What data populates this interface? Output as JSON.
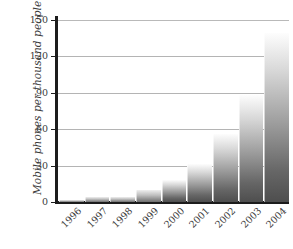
{
  "chart_data": {
    "type": "bar",
    "title": "",
    "xlabel": "",
    "ylabel": "Mobile phones per thousand people",
    "categories": [
      "1996",
      "1997",
      "1998",
      "1999",
      "2000",
      "2001",
      "2002",
      "2003",
      "2004"
    ],
    "values": [
      2,
      4,
      4,
      10,
      18,
      31,
      56,
      88,
      139
    ],
    "ylim": [
      0,
      150
    ],
    "yticks": [
      0,
      30,
      60,
      90,
      120,
      150
    ],
    "ytick_labels": [
      "0",
      "30",
      "60",
      "90",
      "120",
      "150"
    ],
    "grid": true,
    "legend": false,
    "legend_position": "none",
    "series": [
      {
        "name": "Mobile phones per thousand people",
        "values": [
          2,
          4,
          4,
          10,
          18,
          31,
          56,
          88,
          139
        ]
      }
    ],
    "bar_fill": "vertical-gradient-white-to-dark-gray",
    "colors": {
      "bar_top": "#fdfdfd",
      "bar_bottom": "#4e4e4e",
      "axis": "#1c1c1c",
      "gridline": "#b4b4b4",
      "text": "#3b3b3b"
    }
  }
}
